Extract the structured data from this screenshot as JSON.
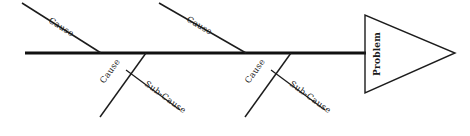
{
  "diagram": {
    "type": "fishbone-cause-and-effect",
    "title": "",
    "colors": {
      "background": "#ffffff",
      "line": "#1c1c1c",
      "spine": "#111111",
      "text": "#1a1a1a"
    },
    "head": {
      "label": "Problem",
      "shape": "triangle-right",
      "points": "365,15 365,93 455,53",
      "label_x": 377,
      "label_y": 54,
      "label_rotation": -90
    },
    "spine": {
      "x1": 25,
      "y1": 53,
      "x2": 366,
      "y2": 53
    },
    "bones": [
      {
        "id": "upper-left-cause",
        "label": "Cause",
        "x1": 22,
        "y1": 3,
        "x2": 101,
        "y2": 53,
        "label_x": 48,
        "label_y": 22,
        "label_rotation": 32
      },
      {
        "id": "upper-right-cause",
        "label": "Cause",
        "x1": 159,
        "y1": 3,
        "x2": 246,
        "y2": 53,
        "label_x": 186,
        "label_y": 21,
        "label_rotation": 30
      },
      {
        "id": "lower-left-cause",
        "label": "Cause",
        "x1": 146,
        "y1": 53,
        "x2": 100,
        "y2": 117,
        "label_x": 104,
        "label_y": 84,
        "label_rotation": -54
      },
      {
        "id": "lower-left-sub-cause",
        "label": "Sub-Cause",
        "x1": 126,
        "y1": 70,
        "x2": 180,
        "y2": 110,
        "label_x": 144,
        "label_y": 85,
        "label_rotation": 36
      },
      {
        "id": "lower-right-cause",
        "label": "Cause",
        "x1": 291,
        "y1": 53,
        "x2": 245,
        "y2": 117,
        "label_x": 249,
        "label_y": 84,
        "label_rotation": -54
      },
      {
        "id": "lower-right-sub-cause",
        "label": "Sub-Cause",
        "x1": 271,
        "y1": 70,
        "x2": 325,
        "y2": 110,
        "label_x": 289,
        "label_y": 85,
        "label_rotation": 36
      }
    ]
  }
}
